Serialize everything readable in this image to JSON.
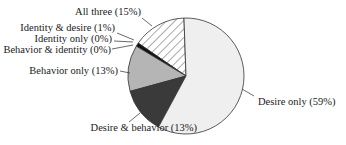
{
  "chart_data": {
    "type": "pie",
    "title": "",
    "slices": [
      {
        "label": "All three",
        "value": 15,
        "display": "All three (15%)",
        "fill": "hatch"
      },
      {
        "label": "Identity & desire",
        "value": 1,
        "display": "Identity & desire (1%)",
        "fill": "#111111"
      },
      {
        "label": "Identity only",
        "value": 0,
        "display": "Identity only (0%)",
        "fill": "#111111"
      },
      {
        "label": "Behavior & identity",
        "value": 0,
        "display": "Behavior & identity (0%)",
        "fill": "#111111"
      },
      {
        "label": "Behavior only",
        "value": 13,
        "display": "Behavior only (13%)",
        "fill": "#b5b5b5"
      },
      {
        "label": "Desire & behavior",
        "value": 13,
        "display": "Desire & behavior (13%)",
        "fill": "#3a3a3a"
      },
      {
        "label": "Desire only",
        "value": 59,
        "display": "Desire only (59%)",
        "fill": "#efefef"
      }
    ],
    "legend": "none (callout labels)"
  },
  "labels": {
    "all_three": "All three (15%)",
    "identity_desire": "Identity & desire (1%)",
    "identity_only": "Identity only (0%)",
    "behavior_identity": "Behavior & identity (0%)",
    "behavior_only": "Behavior only (13%)",
    "desire_behavior": "Desire & behavior (13%)",
    "desire_only": "Desire only (59%)"
  }
}
